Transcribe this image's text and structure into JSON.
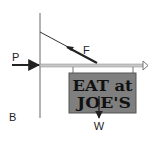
{
  "diagram": {
    "type": "free-body / statics diagram",
    "labels": {
      "force_p": "P",
      "force_f": "F",
      "weight": "W",
      "point_b": "B"
    },
    "sign": {
      "line1": "EAT at",
      "line2": "JOE'S",
      "fill_color": "#7f7f7f",
      "border_color": "#555555"
    },
    "colors": {
      "wall": "#666666",
      "beam": "#bdbdbd",
      "beam_outline": "#777777",
      "cable": "#222222",
      "arrow": "#222222"
    }
  }
}
